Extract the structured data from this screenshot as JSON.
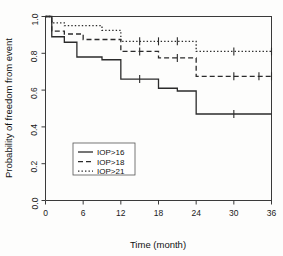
{
  "chart_data": {
    "type": "line",
    "title": "",
    "subtitle": "",
    "xlabel": "Time (month)",
    "ylabel": "Probability of freedom from event",
    "xlim": [
      0,
      36
    ],
    "ylim": [
      0.0,
      1.0
    ],
    "xticks": [
      0,
      6,
      12,
      18,
      24,
      30,
      36
    ],
    "xticklabels": [
      "0",
      "6",
      "12",
      "18",
      "24",
      "30",
      "36"
    ],
    "yticks": [
      0.0,
      0.2,
      0.4,
      0.6,
      0.8,
      1.0
    ],
    "yticklabels": [
      "0.0",
      "0.2",
      "0.4",
      "0.6",
      "0.8",
      "1.0"
    ],
    "grid": false,
    "legend_position": "center-left-lower",
    "plot_kind": "kaplan-meier-step",
    "series": [
      {
        "name": "IOP>16",
        "linestyle": "solid",
        "color": "#2b2b2b",
        "steps": [
          {
            "x": 0,
            "y": 1.0
          },
          {
            "x": 1,
            "y": 0.89
          },
          {
            "x": 3,
            "y": 0.86
          },
          {
            "x": 5,
            "y": 0.78
          },
          {
            "x": 9,
            "y": 0.765
          },
          {
            "x": 12,
            "y": 0.66
          },
          {
            "x": 18,
            "y": 0.61
          },
          {
            "x": 21,
            "y": 0.595
          },
          {
            "x": 24,
            "y": 0.47
          },
          {
            "x": 36,
            "y": 0.47
          }
        ],
        "censor_times": [
          15,
          30
        ]
      },
      {
        "name": "IOP>18",
        "linestyle": "dashed",
        "color": "#2b2b2b",
        "steps": [
          {
            "x": 0,
            "y": 1.0
          },
          {
            "x": 1,
            "y": 0.92
          },
          {
            "x": 3,
            "y": 0.905
          },
          {
            "x": 6,
            "y": 0.875
          },
          {
            "x": 12,
            "y": 0.81
          },
          {
            "x": 18,
            "y": 0.775
          },
          {
            "x": 24,
            "y": 0.675
          },
          {
            "x": 36,
            "y": 0.675
          }
        ],
        "censor_times": [
          15,
          21,
          30,
          34,
          36
        ]
      },
      {
        "name": "IOP>21",
        "linestyle": "dotted",
        "color": "#2b2b2b",
        "steps": [
          {
            "x": 0,
            "y": 1.0
          },
          {
            "x": 1,
            "y": 0.965
          },
          {
            "x": 3,
            "y": 0.95
          },
          {
            "x": 9,
            "y": 0.925
          },
          {
            "x": 12,
            "y": 0.865
          },
          {
            "x": 24,
            "y": 0.81
          },
          {
            "x": 36,
            "y": 0.81
          }
        ],
        "censor_times": [
          15,
          18,
          21,
          30,
          36
        ]
      }
    ]
  },
  "legend": {
    "entries": [
      {
        "label": "IOP>16",
        "linestyle": "solid"
      },
      {
        "label": "IOP>18",
        "linestyle": "dashed"
      },
      {
        "label": "IOP>21",
        "linestyle": "dotted"
      }
    ]
  }
}
